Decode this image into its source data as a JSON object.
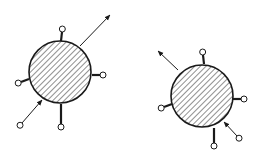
{
  "diagram": {
    "colors": {
      "stroke": "#1a1a1a",
      "background": "#ffffff",
      "hatch": "#333333"
    },
    "particles": [
      {
        "id": "left",
        "cx": 60,
        "cy": 72,
        "r": 31,
        "pins": [
          {
            "x1": 61,
            "y1": 41,
            "x2": 62,
            "y2": 32
          },
          {
            "x1": 92,
            "y1": 75,
            "x2": 100,
            "y2": 75
          },
          {
            "x1": 29,
            "y1": 79,
            "x2": 21,
            "y2": 82
          },
          {
            "x1": 61,
            "y1": 104,
            "x2": 61,
            "y2": 124
          }
        ],
        "arrows": [
          {
            "x1": 80,
            "y1": 46,
            "x2": 110,
            "y2": 15,
            "head": "end"
          },
          {
            "x1": 22,
            "y1": 123,
            "x2": 42,
            "y2": 100,
            "head": "end",
            "ring": true
          }
        ]
      },
      {
        "id": "right",
        "cx": 202,
        "cy": 96,
        "r": 31,
        "pins": [
          {
            "x1": 204,
            "y1": 64,
            "x2": 203,
            "y2": 55
          },
          {
            "x1": 233,
            "y1": 99,
            "x2": 241,
            "y2": 99
          },
          {
            "x1": 172,
            "y1": 104,
            "x2": 164,
            "y2": 107
          },
          {
            "x1": 214,
            "y1": 128,
            "x2": 214,
            "y2": 143
          }
        ],
        "arrows": [
          {
            "x1": 178,
            "y1": 70,
            "x2": 158,
            "y2": 51,
            "head": "end"
          },
          {
            "x1": 237,
            "y1": 136,
            "x2": 224,
            "y2": 122,
            "head": "end",
            "ring": true
          }
        ]
      }
    ]
  }
}
